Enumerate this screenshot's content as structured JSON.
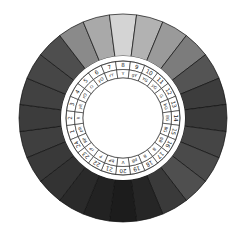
{
  "diagram": {
    "type": "hue-circle",
    "segment_count": 24,
    "center": [
      123,
      118
    ],
    "radii": {
      "outer": 104,
      "color_inner": 62,
      "number_outer": 57,
      "number_inner": 48.5,
      "abbr_inner": 40
    },
    "start_segment": 8,
    "start_angle_deg": -90,
    "step_deg": 15,
    "segments": [
      {
        "number": "1",
        "abbr": "pR",
        "gray": "#3f3f3f"
      },
      {
        "number": "2",
        "abbr": "R",
        "gray": "#3c3c3c"
      },
      {
        "number": "3",
        "abbr": "yR",
        "gray": "#414141"
      },
      {
        "number": "4",
        "abbr": "rO",
        "gray": "#464646"
      },
      {
        "number": "5",
        "abbr": "O",
        "gray": "#4e4e4e"
      },
      {
        "number": "6",
        "abbr": "yO",
        "gray": "#8a8a8a"
      },
      {
        "number": "7",
        "abbr": "rY",
        "gray": "#a9a9a9"
      },
      {
        "number": "8",
        "abbr": "Y",
        "gray": "#d4d4d4"
      },
      {
        "number": "9",
        "abbr": "gY",
        "gray": "#b2b2b2"
      },
      {
        "number": "10",
        "abbr": "YG",
        "gray": "#9a9a9a"
      },
      {
        "number": "11",
        "abbr": "yG",
        "gray": "#7c7c7c"
      },
      {
        "number": "12",
        "abbr": "G",
        "gray": "#545454"
      },
      {
        "number": "13",
        "abbr": "bG",
        "gray": "#3d3d3d"
      },
      {
        "number": "14",
        "abbr": "BG",
        "gray": "#3a3a3a"
      },
      {
        "number": "15",
        "abbr": "BG",
        "gray": "#454545"
      },
      {
        "number": "16",
        "abbr": "gB",
        "gray": "#4a4a4a"
      },
      {
        "number": "17",
        "abbr": "B",
        "gray": "#4f4f4f"
      },
      {
        "number": "18",
        "abbr": "B",
        "gray": "#3a3a3a"
      },
      {
        "number": "19",
        "abbr": "pB",
        "gray": "#262626"
      },
      {
        "number": "20",
        "abbr": "V",
        "gray": "#1c1c1c"
      },
      {
        "number": "21",
        "abbr": "bP",
        "gray": "#222222"
      },
      {
        "number": "22",
        "abbr": "P",
        "gray": "#2a2a2a"
      },
      {
        "number": "23",
        "abbr": "rP",
        "gray": "#333333"
      },
      {
        "number": "24",
        "abbr": "RP",
        "gray": "#393939"
      }
    ],
    "colors": {
      "background": "#ffffff",
      "divider": "#111111",
      "ring_fill": "#ffffff",
      "ring_stroke": "#222222",
      "label_text": "#222222"
    }
  }
}
